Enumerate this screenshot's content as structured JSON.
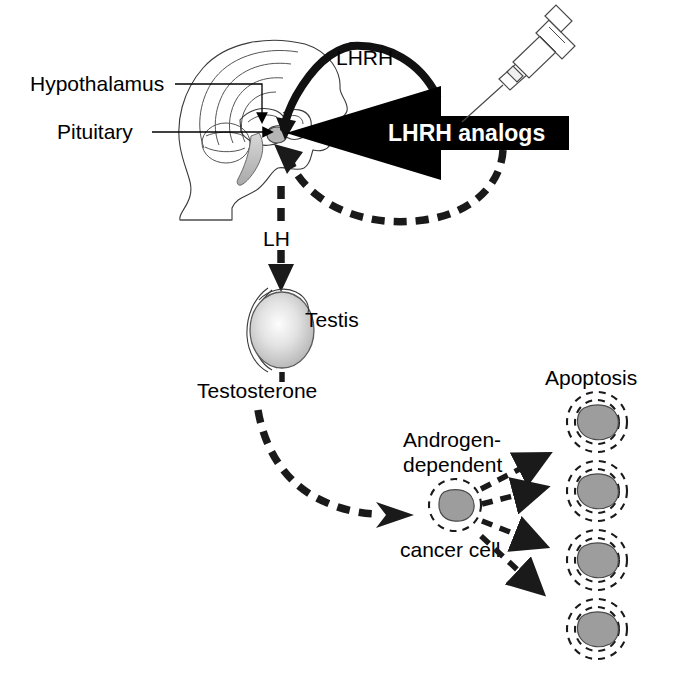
{
  "figure": {
    "labels": {
      "hypothalamus": "Hypothalamus",
      "pituitary": "Pituitary",
      "lhrh": "LHRH",
      "lhrh_analogs": "LHRH analogs",
      "lh": "LH",
      "testis": "Testis",
      "testosterone": "Testosterone",
      "androgen_dependent_line1": "Androgen-",
      "androgen_dependent_line2": "dependent",
      "cancer_cell": "cancer cell",
      "apoptosis": "Apoptosis"
    },
    "icons": {
      "head": "head-profile-icon",
      "brain": "brain-icon",
      "syringe": "syringe-icon",
      "testis": "testis-icon",
      "cell": "cancer-cell-icon",
      "apoptotic_cell": "apoptotic-cell-icon"
    },
    "colors": {
      "ink": "#000000",
      "background": "#ffffff",
      "banner_fill": "#000000",
      "banner_text": "#ffffff",
      "nucleus_gray": "#9d9d9d",
      "testis_gray": "#cfcfcf",
      "outline_gray": "#3a3a3a"
    },
    "arrows": {
      "lhrh_arc": "solid curved arrow from hypothalamus to pituitary",
      "analog_arrow": "large solid black arrow pointing left into the head",
      "lh_arrow": "dashed arrow from pituitary down to testis",
      "testosterone_arrow": "dashed curved arrow from testis to cancer cell",
      "feedback_arrow": "dashed curved feedback arrow to pituitary",
      "apoptosis_arrows": "four dashed arrows from cancer cell to apoptotic cells"
    },
    "apoptotic_cell_count": 4
  }
}
